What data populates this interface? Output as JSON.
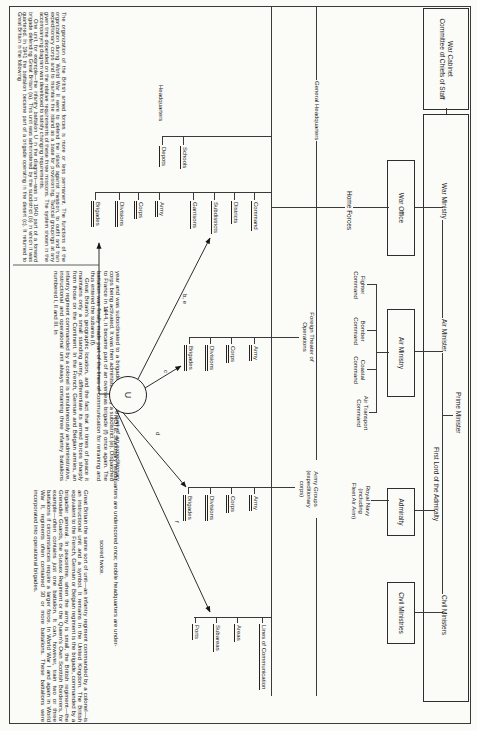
{
  "colors": {
    "paper": "#fbfbf8",
    "ink": "#1c1c1c",
    "line": "#3a3a3a"
  },
  "war_cabinet": {
    "line1": "War Cabinet",
    "line2": "Committee of Chiefs of Staff"
  },
  "ministers": {
    "prime_minister": "Prime Minister",
    "war_ministry": "War Ministry",
    "air_minister": "Air Minister",
    "first_lord": "First Lord of the Admiralty",
    "civil_ministers": "Civil Ministers"
  },
  "ministry_boxes": {
    "war_office": "War Office",
    "air_ministry": "Air Ministry",
    "admiralty": "Admiralty",
    "civil_ministries": "Civil Ministries"
  },
  "commands": {
    "home_forces": "Home Forces",
    "fighter": "Fighter Command",
    "bomber": "Bomber Command",
    "coastal": "Coastal Command",
    "air_transport": "Air Transport Command",
    "royal_navy_1": "Royal Navy",
    "royal_navy_2": "(including",
    "royal_navy_3": "Fleet Air Arm)"
  },
  "sections": {
    "general_headquarters": "General Headquarters",
    "headquarters": "Headquarters",
    "fto_1": "Foreign Theater of",
    "fto_2": "Operations",
    "army_groups_1": "Army Groups",
    "army_groups_2": "(expeditionary",
    "army_groups_3": "corps)"
  },
  "cascades": {
    "home_forces": {
      "items": [
        "Command",
        "Districts",
        "Subdistricts",
        "Garrisons",
        "Army",
        "Corps",
        "Divisions",
        "Brigades"
      ],
      "underscores": [
        1,
        1,
        1,
        1,
        2,
        2,
        2,
        2
      ]
    },
    "training": {
      "items": [
        "Schools",
        "Depots"
      ],
      "underscores": [
        1,
        1
      ]
    },
    "foreign_theater": {
      "items": [
        "Army",
        "Corps",
        "Divisions",
        "Brigades"
      ],
      "underscores": [
        2,
        2,
        2,
        2
      ]
    },
    "army_groups": {
      "items": [
        "Army",
        "Corps",
        "Divisions",
        "Brigades"
      ],
      "underscores": [
        2,
        2,
        2,
        2
      ]
    },
    "lines_of_communication": {
      "items": [
        "Lines of Communication",
        "Areas",
        "Subareas",
        "Ports"
      ],
      "underscores": [
        1,
        1,
        1,
        1
      ]
    }
  },
  "unit": {
    "symbol": "U"
  },
  "arrow_labels": {
    "a": "a",
    "be": "b, e",
    "c": "c",
    "d": "d",
    "f": "f"
  },
  "note": {
    "line1": "NOTE: Stationary headquarters are underscored once; mobile headquarters are under-",
    "line2": "scored twice."
  },
  "captions": {
    "col1_p1": "The organization of the British armed forces is more or less permanent. The functions of the organization during World War II were to defend the island against invasion, to outfit and train expeditionary corps and to maintain the island as a base for provisioning. Tactical groupings at any given time depended on the relative requirements of these three missions. The system shown in the accompanying diagram was developed to satisfy changing requirements.",
    "col1_p2": "One unit, for example—the infantry battalion U in the diagram—was in 1940 part of a forward brigade defending Great Britain (a). This unit was administered by the subdistrict (b) in which it was quartered. In 1941 the battalion became part of a brigade operating in the desert (c). It returned to Great Britain in the following",
    "col2_p1": "year and was subordinated to a brigade (d), forming part of an expeditionary corps being activated. It was then administered by a subdistrict (e). Dispatched to France in 1944, it became part of an overseas brigade (f) once again. The battalion was finally made part of the lines of communication for retraining and thus entered the subarea (f).",
    "col2_p2": "Great Britain's geographic location, and the fact that in times of peace it maintains only a small standing army, differentiate its armed forces sharply from those on the Continent. In the French, German and Belgian armies, an infantry regiment commanded by a colonel is simultaneously an administrative, instructional and operational unit always containing three infantry battalions numbered I, II and III. In",
    "col3_p1": "Great Britain the same sort of unit—an infantry regiment commanded by a colonel—is an instructional unit and a symbol. It remains in the United Kingdom. The British equivalent to the French, German or Belgian regiment is the brigade, commanded by a brigadier general. In peacetime, when the army is small, the British regiment—the Grenadier Guards, the Sussex Regiment or the Queen's Own Scottish Borderers, for example—often contains just one battalion. It can, however, train two or three battalions if circumstances require a larger force. In World War I and again in World War II, regiments often contained 30 or more battalions. These battalions were incorporated into operational brigades."
  }
}
